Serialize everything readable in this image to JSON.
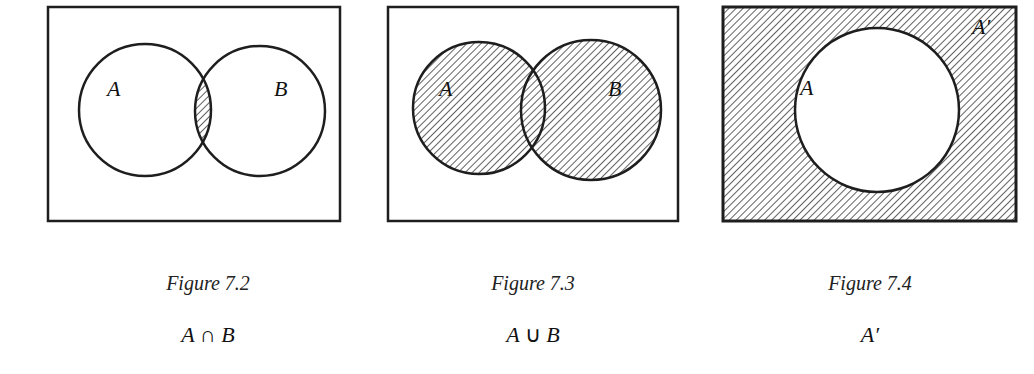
{
  "figures": [
    {
      "id": "fig-7-2",
      "caption": "Figure 7.2",
      "formula_left": "A",
      "formula_op": "∩",
      "formula_right": "B",
      "labels": {
        "a": "A",
        "b": "B"
      },
      "shaded_region": "intersection"
    },
    {
      "id": "fig-7-3",
      "caption": "Figure 7.3",
      "formula_left": "A",
      "formula_op": "∪",
      "formula_right": "B",
      "labels": {
        "a": "A",
        "b": "B"
      },
      "shaded_region": "union"
    },
    {
      "id": "fig-7-4",
      "caption": "Figure 7.4",
      "formula": "A′",
      "labels": {
        "a": "A",
        "complement": "A′"
      },
      "shaded_region": "complement"
    }
  ],
  "colors": {
    "stroke": "#1e1e1e",
    "hatch": "#3a3a3a",
    "background": "#ffffff"
  }
}
